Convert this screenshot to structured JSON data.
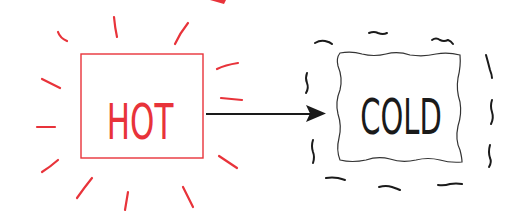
{
  "diagram": {
    "hot_box": {
      "label": "HOT",
      "color": "#e8333a"
    },
    "cold_box": {
      "label": "COLD",
      "color": "#1a1a1a"
    },
    "arrow": {
      "from": "HOT",
      "to": "COLD",
      "color": "#1a1a1a"
    },
    "decorations": {
      "hot": "radiating-heat-lines",
      "cold": "wavy-shiver-lines",
      "top_red_shape": "partial-red-arrowhead"
    }
  }
}
